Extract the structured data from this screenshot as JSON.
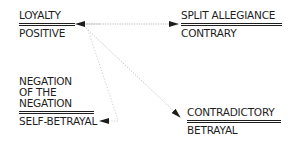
{
  "diagram": {
    "type": "semiotic-square",
    "nodes": [
      {
        "id": "loyalty",
        "top_label": "LOYALTY",
        "bottom_label": "POSITIVE"
      },
      {
        "id": "split",
        "top_label": "SPLIT ALLEGIANCE",
        "bottom_label": "CONTRARY"
      },
      {
        "id": "negation",
        "top_lines": [
          "NEGATION",
          "OF THE",
          "NEGATION"
        ],
        "bottom_label": "SELF-BETRAYAL"
      },
      {
        "id": "contradictory",
        "top_label": "CONTRADICTORY",
        "bottom_label": "BETRAYAL"
      }
    ],
    "edges": [
      {
        "from": "loyalty",
        "to": "split",
        "style": "dotted",
        "direction": "both"
      },
      {
        "from": "loyalty",
        "to": "contradictory",
        "style": "dotted",
        "direction": "to"
      },
      {
        "from": "loyalty",
        "to": "negation",
        "style": "dotted",
        "direction": "to"
      }
    ],
    "colors": {
      "text": "#1e1e1e",
      "arrow": "#9a9a9a",
      "arrowhead": "#1e1e1e"
    }
  }
}
